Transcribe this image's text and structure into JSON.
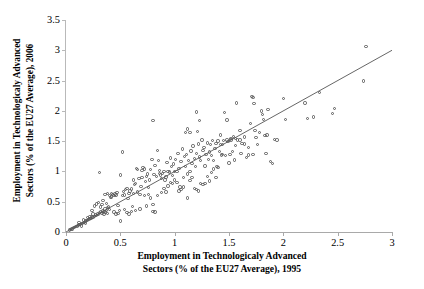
{
  "chart_data": {
    "type": "scatter",
    "title": "",
    "xlabel_lines": [
      "Employment in Technologicaly Advanced",
      "Sectors  (% of the EU27 Average), 1995"
    ],
    "ylabel_lines": [
      "Employment in Technologicaly Advanced",
      "Sectors (% of the EU27 Average), 2006"
    ],
    "xlabel": "Employment in Technologicaly Advanced Sectors  (% of the EU27 Average), 1995",
    "ylabel": "Employment in Technologicaly Advanced Sectors (% of the EU27 Average), 2006",
    "xlim": [
      0,
      3
    ],
    "ylim": [
      0,
      3.5
    ],
    "xticks": [
      0,
      0.5,
      1,
      1.5,
      2,
      2.5,
      3
    ],
    "xticklabels": [
      "0",
      "0.5",
      "1",
      "1.5",
      "2",
      "2.5",
      "3"
    ],
    "yticks": [
      0,
      0.5,
      1,
      1.5,
      2,
      2.5,
      3,
      3.5
    ],
    "yticklabels": [
      "0",
      "0.5",
      "1",
      "1.5",
      "2",
      "2.5",
      "3",
      "3.5"
    ],
    "grid": false,
    "legend": null,
    "marker": "open-circle",
    "marker_color": "#5a5a5a",
    "reference_line": {
      "type": "identity",
      "from": [
        0,
        0
      ],
      "to": [
        3,
        3
      ],
      "color": "#555555",
      "label": ""
    },
    "points": [
      [
        0.03,
        0.03
      ],
      [
        0.04,
        0.04
      ],
      [
        0.05,
        0.05
      ],
      [
        0.06,
        0.05
      ],
      [
        0.07,
        0.07
      ],
      [
        0.08,
        0.07
      ],
      [
        0.09,
        0.09
      ],
      [
        0.1,
        0.09
      ],
      [
        0.11,
        0.11
      ],
      [
        0.12,
        0.12
      ],
      [
        0.13,
        0.12
      ],
      [
        0.14,
        0.14
      ],
      [
        0.15,
        0.14
      ],
      [
        0.16,
        0.16
      ],
      [
        0.17,
        0.16
      ],
      [
        0.18,
        0.18
      ],
      [
        0.19,
        0.19
      ],
      [
        0.2,
        0.19
      ],
      [
        0.21,
        0.21
      ],
      [
        0.22,
        0.22
      ],
      [
        0.23,
        0.22
      ],
      [
        0.24,
        0.25
      ],
      [
        0.25,
        0.24
      ],
      [
        0.26,
        0.26
      ],
      [
        0.27,
        0.28
      ],
      [
        0.28,
        0.27
      ],
      [
        0.29,
        0.3
      ],
      [
        0.3,
        0.29
      ],
      [
        0.31,
        0.32
      ],
      [
        0.32,
        0.33
      ],
      [
        0.33,
        0.31
      ],
      [
        0.34,
        0.35
      ],
      [
        0.35,
        0.34
      ],
      [
        0.36,
        0.38
      ],
      [
        0.37,
        0.36
      ],
      [
        0.38,
        0.4
      ],
      [
        0.24,
        0.36
      ],
      [
        0.25,
        0.3
      ],
      [
        0.26,
        0.43
      ],
      [
        0.28,
        0.46
      ],
      [
        0.3,
        0.49
      ],
      [
        0.31,
        0.98
      ],
      [
        0.32,
        0.41
      ],
      [
        0.33,
        0.45
      ],
      [
        0.34,
        0.52
      ],
      [
        0.35,
        0.3
      ],
      [
        0.36,
        0.33
      ],
      [
        0.37,
        0.47
      ],
      [
        0.38,
        0.31
      ],
      [
        0.39,
        0.41
      ],
      [
        0.4,
        0.37
      ],
      [
        0.41,
        0.57
      ],
      [
        0.42,
        0.58
      ],
      [
        0.43,
        0.62
      ],
      [
        0.44,
        0.6
      ],
      [
        0.45,
        0.63
      ],
      [
        0.46,
        0.61
      ],
      [
        0.47,
        0.65
      ],
      [
        0.48,
        0.44
      ],
      [
        0.49,
        0.36
      ],
      [
        0.5,
        0.18
      ],
      [
        0.5,
        0.94
      ],
      [
        0.52,
        1.32
      ],
      [
        0.53,
        0.67
      ],
      [
        0.54,
        0.61
      ],
      [
        0.55,
        0.7
      ],
      [
        0.56,
        0.72
      ],
      [
        0.57,
        0.55
      ],
      [
        0.58,
        0.64
      ],
      [
        0.59,
        0.68
      ],
      [
        0.6,
        0.71
      ],
      [
        0.61,
        0.42
      ],
      [
        0.62,
        0.86
      ],
      [
        0.63,
        0.78
      ],
      [
        0.64,
        0.8
      ],
      [
        0.65,
        1.05
      ],
      [
        0.66,
        1.03
      ],
      [
        0.67,
        0.88
      ],
      [
        0.68,
        0.62
      ],
      [
        0.69,
        0.75
      ],
      [
        0.7,
        0.9
      ],
      [
        0.71,
        1.06
      ],
      [
        0.72,
        0.6
      ],
      [
        0.73,
        0.83
      ],
      [
        0.74,
        0.43
      ],
      [
        0.75,
        0.96
      ],
      [
        0.76,
        0.73
      ],
      [
        0.77,
        0.86
      ],
      [
        0.78,
        1.03
      ],
      [
        0.79,
        1.2
      ],
      [
        0.8,
        1.84
      ],
      [
        0.8,
        0.45
      ],
      [
        0.81,
        0.95
      ],
      [
        0.82,
        1.1
      ],
      [
        0.83,
        0.92
      ],
      [
        0.84,
        1.35
      ],
      [
        0.85,
        1.18
      ],
      [
        0.86,
        1.02
      ],
      [
        0.87,
        0.94
      ],
      [
        0.88,
        0.88
      ],
      [
        0.89,
        0.97
      ],
      [
        0.9,
        1.0
      ],
      [
        0.91,
        0.86
      ],
      [
        0.92,
        0.91
      ],
      [
        0.93,
        1.15
      ],
      [
        0.94,
        0.76
      ],
      [
        0.95,
        0.99
      ],
      [
        0.96,
        1.22
      ],
      [
        0.97,
        1.08
      ],
      [
        0.98,
        0.93
      ],
      [
        0.99,
        1.12
      ],
      [
        1.0,
        1.0
      ],
      [
        1.01,
        1.2
      ],
      [
        1.02,
        0.82
      ],
      [
        1.03,
        1.3
      ],
      [
        1.04,
        1.05
      ],
      [
        1.05,
        0.74
      ],
      [
        1.06,
        1.16
      ],
      [
        1.07,
        1.37
      ],
      [
        1.08,
        0.9
      ],
      [
        1.09,
        1.25
      ],
      [
        1.1,
        1.64
      ],
      [
        1.1,
        1.08
      ],
      [
        1.11,
        1.28
      ],
      [
        1.12,
        1.7
      ],
      [
        1.12,
        0.96
      ],
      [
        1.13,
        1.18
      ],
      [
        1.14,
        1.64
      ],
      [
        1.14,
        0.85
      ],
      [
        1.15,
        1.34
      ],
      [
        1.16,
        1.13
      ],
      [
        1.17,
        1.42
      ],
      [
        1.18,
        1.21
      ],
      [
        1.19,
        1.08
      ],
      [
        1.2,
        1.98
      ],
      [
        1.2,
        1.3
      ],
      [
        1.21,
        1.66
      ],
      [
        1.22,
        1.45
      ],
      [
        1.23,
        1.84
      ],
      [
        1.23,
        1.24
      ],
      [
        1.24,
        1.18
      ],
      [
        1.25,
        1.52
      ],
      [
        1.26,
        1.35
      ],
      [
        1.27,
        1.4
      ],
      [
        1.28,
        1.09
      ],
      [
        1.29,
        1.28
      ],
      [
        1.3,
        1.47
      ],
      [
        1.31,
        1.2
      ],
      [
        1.32,
        1.32
      ],
      [
        1.33,
        1.44
      ],
      [
        1.34,
        1.26
      ],
      [
        1.35,
        1.51
      ],
      [
        1.36,
        1.18
      ],
      [
        1.37,
        1.38
      ],
      [
        1.38,
        1.46
      ],
      [
        1.39,
        1.08
      ],
      [
        1.4,
        1.5
      ],
      [
        1.41,
        1.33
      ],
      [
        1.42,
        1.6
      ],
      [
        1.43,
        1.27
      ],
      [
        1.44,
        1.44
      ],
      [
        1.45,
        1.51
      ],
      [
        1.46,
        1.97
      ],
      [
        1.47,
        1.26
      ],
      [
        1.48,
        1.85
      ],
      [
        1.49,
        1.49
      ],
      [
        1.5,
        1.14
      ],
      [
        1.51,
        1.28
      ],
      [
        1.52,
        1.54
      ],
      [
        1.53,
        1.33
      ],
      [
        1.54,
        1.58
      ],
      [
        1.55,
        1.19
      ],
      [
        1.56,
        1.43
      ],
      [
        1.57,
        2.13
      ],
      [
        1.58,
        1.52
      ],
      [
        1.6,
        1.68
      ],
      [
        1.61,
        1.3
      ],
      [
        1.62,
        1.46
      ],
      [
        1.64,
        1.57
      ],
      [
        1.66,
        1.23
      ],
      [
        1.68,
        1.4
      ],
      [
        1.7,
        1.79
      ],
      [
        1.71,
        2.24
      ],
      [
        1.72,
        2.22
      ],
      [
        1.73,
        2.12
      ],
      [
        1.74,
        1.68
      ],
      [
        1.75,
        1.56
      ],
      [
        1.76,
        1.44
      ],
      [
        1.78,
        1.64
      ],
      [
        1.8,
        2.0
      ],
      [
        1.81,
        1.94
      ],
      [
        1.82,
        1.86
      ],
      [
        1.83,
        1.59
      ],
      [
        1.84,
        1.3
      ],
      [
        1.85,
        1.6
      ],
      [
        1.86,
        2.02
      ],
      [
        1.88,
        1.16
      ],
      [
        1.9,
        1.13
      ],
      [
        1.92,
        1.53
      ],
      [
        1.94,
        1.52
      ],
      [
        2.0,
        2.2
      ],
      [
        2.02,
        1.86
      ],
      [
        2.2,
        2.13
      ],
      [
        2.22,
        1.87
      ],
      [
        2.28,
        1.9
      ],
      [
        2.33,
        2.3
      ],
      [
        2.45,
        1.96
      ],
      [
        2.47,
        2.04
      ],
      [
        2.74,
        2.49
      ],
      [
        2.76,
        3.06
      ],
      [
        0.44,
        0.33
      ],
      [
        0.46,
        0.3
      ],
      [
        0.48,
        0.31
      ],
      [
        0.52,
        0.6
      ],
      [
        0.56,
        0.32
      ],
      [
        0.58,
        0.3
      ],
      [
        0.6,
        0.34
      ],
      [
        0.62,
        0.64
      ],
      [
        0.66,
        0.66
      ],
      [
        0.7,
        1.02
      ],
      [
        0.72,
        1.04
      ],
      [
        0.76,
        0.62
      ],
      [
        0.8,
        0.34
      ],
      [
        0.82,
        0.33
      ],
      [
        0.88,
        0.65
      ],
      [
        0.9,
        0.72
      ],
      [
        0.92,
        0.66
      ],
      [
        0.96,
        0.82
      ],
      [
        1.0,
        0.86
      ],
      [
        1.04,
        0.68
      ],
      [
        1.06,
        0.7
      ],
      [
        1.08,
        0.74
      ],
      [
        1.12,
        0.56
      ],
      [
        1.18,
        0.72
      ],
      [
        1.2,
        0.7
      ],
      [
        1.22,
        0.68
      ],
      [
        1.24,
        0.8
      ],
      [
        1.26,
        0.78
      ],
      [
        1.3,
        0.92
      ],
      [
        1.34,
        0.98
      ],
      [
        1.36,
        1.04
      ],
      [
        1.4,
        1.06
      ],
      [
        1.44,
        1.28
      ],
      [
        1.48,
        1.52
      ],
      [
        1.52,
        1.52
      ],
      [
        1.56,
        1.54
      ],
      [
        1.6,
        1.52
      ],
      [
        1.64,
        1.45
      ],
      [
        1.68,
        1.27
      ],
      [
        1.72,
        1.28
      ],
      [
        0.36,
        0.62
      ],
      [
        0.38,
        0.64
      ],
      [
        0.4,
        0.6
      ],
      [
        0.42,
        0.64
      ],
      [
        0.54,
        0.37
      ],
      [
        0.64,
        0.36
      ],
      [
        0.68,
        0.38
      ],
      [
        0.74,
        0.92
      ],
      [
        0.78,
        0.56
      ],
      [
        0.84,
        0.6
      ],
      [
        0.86,
        0.97
      ],
      [
        0.94,
        1.0
      ],
      [
        0.98,
        0.8
      ],
      [
        1.02,
        1.0
      ],
      [
        1.14,
        1.0
      ],
      [
        1.16,
        0.9
      ],
      [
        1.28,
        0.8
      ],
      [
        1.32,
        0.84
      ],
      [
        1.38,
        0.9
      ],
      [
        1.42,
        1.44
      ],
      [
        0.2,
        0.24
      ],
      [
        0.22,
        0.26
      ],
      [
        0.16,
        0.2
      ],
      [
        0.18,
        0.15
      ],
      [
        0.12,
        0.16
      ],
      [
        0.14,
        0.1
      ]
    ]
  }
}
